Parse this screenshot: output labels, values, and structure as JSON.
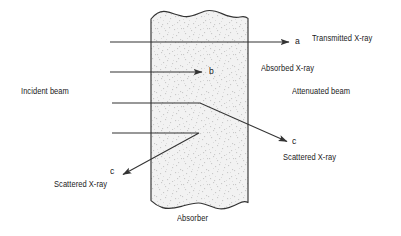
{
  "figure": {
    "type": "schematic-diagram",
    "width": 401,
    "height": 236,
    "background_color": "#ffffff",
    "line_color": "#333333",
    "text_color": "#1a1a1a",
    "absorber_fill_color": "#e9e9e9"
  },
  "labels": {
    "ray_a": "a",
    "ray_b": "b",
    "ray_c_right": "c",
    "ray_c_left": "c",
    "transmitted": "Transmitted X-ray",
    "absorbed": "Absorbed X-ray",
    "incident_beam": "Incident beam",
    "attenuated_beam": "Attenuated beam",
    "scattered_right": "Scattered X-ray",
    "scattered_left": "Scattered X-ray",
    "absorber": "Absorber"
  },
  "diagram_elements": {
    "absorber_block": {
      "name": "absorber",
      "left_edge_x": 151,
      "right_edge_x": 248,
      "top_y": 12,
      "bottom_y": 210,
      "top_edge_style": "wavy-broken",
      "bottom_edge_style": "wavy-broken",
      "fill": "stipple-texture"
    },
    "beams": [
      {
        "id": "a",
        "name": "transmitted-ray",
        "description": "Passes straight through the absorber and exits to the right",
        "path": "horizontal",
        "start": [
          110,
          42
        ],
        "end": [
          290,
          42
        ],
        "arrowhead": "right"
      },
      {
        "id": "b",
        "name": "absorbed-ray",
        "description": "Terminates inside the absorber; fully absorbed",
        "path": "horizontal",
        "start": [
          110,
          72
        ],
        "end": [
          203,
          72
        ],
        "arrowhead": "right"
      },
      {
        "id": "c-right",
        "name": "scattered-ray-forward",
        "description": "Enters, scatters at a point in the absorber, exits down-right",
        "path": "bent",
        "start": [
          112,
          103
        ],
        "bend": [
          200,
          103
        ],
        "end": [
          288,
          142
        ],
        "arrowhead": "end"
      },
      {
        "id": "c-left",
        "name": "scattered-ray-backward",
        "description": "Enters, scatters at a point in the absorber, exits down-left (backscatter)",
        "path": "bent",
        "start": [
          112,
          133
        ],
        "bend": [
          199,
          133
        ],
        "end": [
          122,
          175
        ],
        "arrowhead": "end"
      }
    ]
  }
}
